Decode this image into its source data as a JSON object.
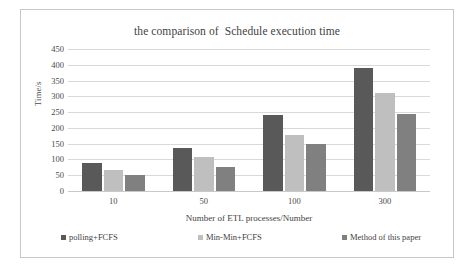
{
  "chart_data": {
    "type": "bar",
    "title": "the comparison of  Schedule execution time",
    "xlabel": "Number of ETL processes/Number",
    "ylabel": "Time/s",
    "categories": [
      "10",
      "50",
      "100",
      "300"
    ],
    "ylim": [
      0,
      450
    ],
    "yticks": [
      "450",
      "400",
      "350",
      "300",
      "250",
      "200",
      "150",
      "100",
      "50",
      "0"
    ],
    "ytick_values": [
      450,
      400,
      350,
      300,
      250,
      200,
      150,
      100,
      50,
      0
    ],
    "grid": true,
    "legend_position": "bottom",
    "series": [
      {
        "name": "polling+FCFS",
        "color": "#595959",
        "values": [
          88,
          137,
          240,
          390
        ]
      },
      {
        "name": "Min-Min+FCFS",
        "color": "#bfbfbf",
        "values": [
          66,
          108,
          178,
          310
        ]
      },
      {
        "name": "Method of this paper",
        "color": "#808080",
        "values": [
          52,
          77,
          148,
          245
        ]
      }
    ]
  }
}
